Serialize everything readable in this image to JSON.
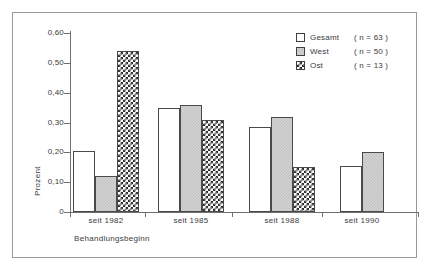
{
  "chart_data": {
    "type": "bar",
    "title": "",
    "xlabel": "Behandlungsbeginn",
    "ylabel": "Prozent",
    "categories": [
      "seit 1982",
      "seit 1985",
      "seit 1988",
      "seit 1990"
    ],
    "ylim": [
      0,
      0.6
    ],
    "ytick_labels": [
      "0",
      "0,10",
      "0,20",
      "0,30",
      "0,40",
      "0,50",
      "0,60"
    ],
    "ytick_values": [
      0,
      0.1,
      0.2,
      0.3,
      0.4,
      0.5,
      0.6
    ],
    "grid": false,
    "legend_position": "top-right",
    "series": [
      {
        "name": "Gesamt",
        "n_label": "( n =  63 )",
        "values": [
          0.205,
          0.35,
          0.285,
          0.155
        ],
        "fill": "white"
      },
      {
        "name": "West",
        "n_label": "( n = 50 )",
        "values": [
          0.12,
          0.36,
          0.32,
          0.2
        ],
        "fill": "gray"
      },
      {
        "name": "Ost",
        "n_label": "( n = 13 )",
        "values": [
          0.54,
          0.31,
          0.15,
          null
        ],
        "fill": "checkered"
      }
    ]
  },
  "colors": {
    "axis": "#6f6f6f",
    "bar_outline": "#4a4a4a",
    "gesamt_fill": "#ffffff",
    "west_fill": "#d2d2d2",
    "ost_fill": "#2e2e2e",
    "frame": "#9a9a9a",
    "text": "#3a3a3a"
  }
}
